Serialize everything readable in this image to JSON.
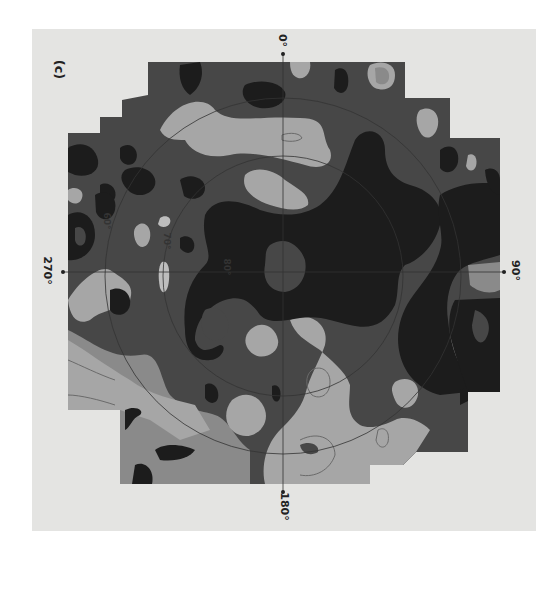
{
  "figure": {
    "panel_label": "(c)",
    "axis_labels": {
      "top": "0°",
      "right": "90°",
      "bottom": "180°",
      "left": "270°"
    },
    "circle_labels": [
      "60°",
      "70°",
      "80°"
    ],
    "orientation": "rotated 90° clockwise",
    "type": "polar contour map (grayscale shaded levels)"
  },
  "colors": {
    "background": "#e4e4e2",
    "level_darkest": "#1c1c1c",
    "level_dark": "#474747",
    "level_mid": "#8a8a8a",
    "level_light": "#a6a6a6",
    "level_lightest": "#bdbdbd",
    "grid_line": "#3a3a3a"
  }
}
